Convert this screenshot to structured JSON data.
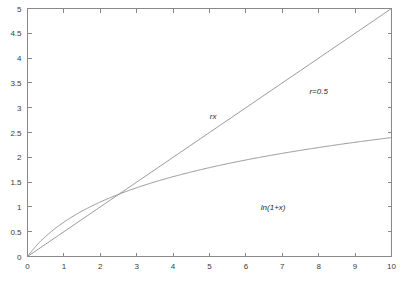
{
  "chart_data": {
    "type": "line",
    "title": "",
    "subtitle": "",
    "xlabel": "",
    "ylabel": "",
    "xlim": [
      0,
      10
    ],
    "ylim": [
      0,
      5
    ],
    "grid": false,
    "legend_position": "none",
    "x_ticks": [
      "0",
      "1",
      "2",
      "3",
      "4",
      "5",
      "6",
      "7",
      "8",
      "9",
      "10"
    ],
    "x_tick_values": [
      0,
      1,
      2,
      3,
      4,
      5,
      6,
      7,
      8,
      9,
      10
    ],
    "y_ticks": [
      "0",
      "0.5",
      "1",
      "1.5",
      "2",
      "2.5",
      "3",
      "3.5",
      "4",
      "4.5",
      "5"
    ],
    "y_tick_values": [
      0,
      0.5,
      1,
      1.5,
      2,
      2.5,
      3,
      3.5,
      4,
      4.5,
      5
    ],
    "parameters": {
      "r": 0.5
    },
    "series": [
      {
        "name": "rx",
        "formula": "r*x with r=0.5",
        "color": "#8a8a8a",
        "x": [
          0,
          1,
          2,
          3,
          4,
          5,
          6,
          7,
          8,
          9,
          10
        ],
        "values": [
          0,
          0.5,
          1.0,
          1.5,
          2.0,
          2.5,
          3.0,
          3.5,
          4.0,
          4.5,
          5.0
        ]
      },
      {
        "name": "ln(1+x)",
        "formula": "ln(1+x)",
        "color": "#8a8a8a",
        "x": [
          0,
          0.5,
          1,
          1.5,
          2,
          2.5,
          3,
          3.5,
          4,
          5,
          6,
          7,
          8,
          9,
          10
        ],
        "values": [
          0,
          0.405,
          0.693,
          0.916,
          1.099,
          1.253,
          1.386,
          1.504,
          1.609,
          1.792,
          1.946,
          2.079,
          2.197,
          2.303,
          2.398
        ]
      }
    ],
    "intersections": [
      {
        "x": 0,
        "y": 0
      },
      {
        "x": 2.513,
        "y": 1.257
      }
    ],
    "annotations": [
      {
        "id": "rx",
        "text": "rx",
        "x": 5.1,
        "y": 2.78,
        "style": "italic"
      },
      {
        "id": "r-value",
        "text": "r=0.5",
        "x": 8.0,
        "y": 3.28,
        "style": "italic"
      },
      {
        "id": "ln-label",
        "text": "ln(1+x)",
        "x": 6.75,
        "y": 0.93,
        "style": "italic"
      }
    ]
  },
  "figure": {
    "background_color": "#ffffff",
    "axis_color": "#888888",
    "line_color": "#8a8a8a",
    "text_color": "#3a3a3a"
  }
}
